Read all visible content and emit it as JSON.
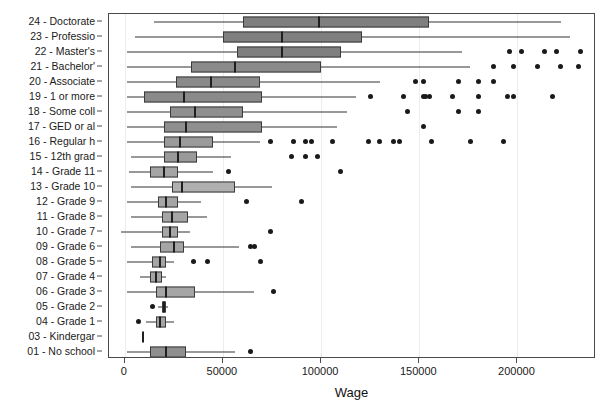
{
  "chart_data": {
    "type": "box",
    "title": "",
    "xlabel": "Wage",
    "ylabel": "",
    "xlim": [
      -8000,
      240000
    ],
    "xticks": [
      0,
      50000,
      100000,
      150000,
      200000
    ],
    "xticklabels": [
      "0",
      "50000",
      "100000",
      "150000",
      "200000"
    ],
    "grid": true,
    "grid_axis": "x",
    "legend": "none",
    "orientation": "horizontal",
    "categories": [
      "24 - Doctorate",
      "23 - Professio",
      "22 - Master's",
      "21 - Bachelor'",
      "20 - Associate",
      "19 - 1 or more",
      "18 - Some coll",
      "17 - GED or al",
      "16 - Regular h",
      "15 - 12th grad",
      "14 - Grade 11",
      "13 - Grade 10",
      "12 - Grade 9",
      "11 - Grade 8",
      "10 - Grade 7",
      "09 - Grade 6",
      "08 - Grade 5",
      "07 - Grade 4",
      "06 - Grade 3",
      "05 - Grade 2",
      "04 - Grade 1",
      "03 - Kindergar",
      "01 - No school"
    ],
    "boxes": [
      {
        "category": "24 - Doctorate",
        "whisker_low": 15000,
        "q1": 60000,
        "median": 99000,
        "q3": 155000,
        "whisker_high": 222000,
        "fill": "#7f7f7f",
        "outliers": []
      },
      {
        "category": "23 - Professio",
        "whisker_low": 5000,
        "q1": 50000,
        "median": 80000,
        "q3": 121000,
        "whisker_high": 227000,
        "fill": "#7f7f7f",
        "outliers": []
      },
      {
        "category": "22 - Master's",
        "whisker_low": 1000,
        "q1": 57000,
        "median": 80000,
        "q3": 110000,
        "whisker_high": 172000,
        "fill": "#7f7f7f",
        "outliers": [
          196000,
          202000,
          214000,
          220000,
          232000
        ]
      },
      {
        "category": "21 - Bachelor'",
        "whisker_low": 1000,
        "q1": 34000,
        "median": 56000,
        "q3": 100000,
        "whisker_high": 176000,
        "fill": "#8a8a8a",
        "outliers": [
          188000,
          198000,
          210000,
          222000,
          231000
        ]
      },
      {
        "category": "20 - Associate",
        "whisker_low": 1000,
        "q1": 26000,
        "median": 44000,
        "q3": 69000,
        "whisker_high": 130000,
        "fill": "#8a8a8a",
        "outliers": [
          148000,
          152000,
          170000,
          180000,
          188000
        ]
      },
      {
        "category": "19 - 1 or more",
        "whisker_low": 1000,
        "q1": 10000,
        "median": 30000,
        "q3": 70000,
        "whisker_high": 118000,
        "fill": "#8a8a8a",
        "outliers": [
          125000,
          142000,
          152000,
          153000,
          155000,
          167000,
          180000,
          195000,
          198000,
          218000
        ]
      },
      {
        "category": "18 - Some coll",
        "whisker_low": 1000,
        "q1": 23000,
        "median": 36000,
        "q3": 60000,
        "whisker_high": 113000,
        "fill": "#8f8f8f",
        "outliers": [
          144000,
          170000,
          180000
        ]
      },
      {
        "category": "17 - GED or al",
        "whisker_low": 1000,
        "q1": 20000,
        "median": 31000,
        "q3": 70000,
        "whisker_high": 108000,
        "fill": "#8f8f8f",
        "outliers": [
          152000
        ]
      },
      {
        "category": "16 - Regular h",
        "whisker_low": 1000,
        "q1": 20000,
        "median": 28000,
        "q3": 45000,
        "whisker_high": 69000,
        "fill": "#9a9a9a",
        "outliers": [
          74000,
          86000,
          92000,
          95000,
          106000,
          124000,
          130000,
          137000,
          140000,
          156000,
          176000,
          193000
        ]
      },
      {
        "category": "15 - 12th grad",
        "whisker_low": 3000,
        "q1": 20000,
        "median": 27000,
        "q3": 37000,
        "whisker_high": 54000,
        "fill": "#9a9a9a",
        "outliers": [
          85000,
          92000,
          98000
        ]
      },
      {
        "category": "14 - Grade 11",
        "whisker_low": 2000,
        "q1": 13000,
        "median": 20000,
        "q3": 27000,
        "whisker_high": 45000,
        "fill": "#a5a5a5",
        "outliers": [
          53000,
          110000
        ]
      },
      {
        "category": "13 - Grade 10",
        "whisker_low": 3000,
        "q1": 24000,
        "median": 29000,
        "q3": 56000,
        "whisker_high": 75000,
        "fill": "#b0b0b0",
        "outliers": []
      },
      {
        "category": "12 - Grade 9",
        "whisker_low": 1000,
        "q1": 17000,
        "median": 21000,
        "q3": 27000,
        "whisker_high": 39000,
        "fill": "#a5a5a5",
        "outliers": [
          62000,
          90000
        ]
      },
      {
        "category": "11 - Grade 8",
        "whisker_low": 3000,
        "q1": 19000,
        "median": 24000,
        "q3": 32000,
        "whisker_high": 42000,
        "fill": "#a5a5a5",
        "outliers": []
      },
      {
        "category": "10 - Grade 7",
        "whisker_low": -2000,
        "q1": 19000,
        "median": 23000,
        "q3": 27000,
        "whisker_high": 33000,
        "fill": "#a5a5a5",
        "outliers": [
          74000
        ]
      },
      {
        "category": "09 - Grade 6",
        "whisker_low": 3000,
        "q1": 18000,
        "median": 25000,
        "q3": 30000,
        "whisker_high": 58000,
        "fill": "#a5a5a5",
        "outliers": [
          64000,
          66000
        ]
      },
      {
        "category": "08 - Grade 5",
        "whisker_low": 1000,
        "q1": 14000,
        "median": 18000,
        "q3": 21000,
        "whisker_high": 25000,
        "fill": "#a5a5a5",
        "outliers": [
          35000,
          42000,
          69000
        ]
      },
      {
        "category": "07 - Grade 4",
        "whisker_low": 8000,
        "q1": 13000,
        "median": 16000,
        "q3": 19000,
        "whisker_high": 21000,
        "fill": "#a5a5a5",
        "outliers": []
      },
      {
        "category": "06 - Grade 3",
        "whisker_low": 1000,
        "q1": 16000,
        "median": 21000,
        "q3": 36000,
        "whisker_high": 66000,
        "fill": "#a5a5a5",
        "outliers": [
          76000
        ]
      },
      {
        "category": "05 - Grade 2",
        "whisker_low": 17000,
        "q1": 19000,
        "median": 20000,
        "q3": 21000,
        "whisker_high": 22000,
        "fill": "#a5a5a5",
        "outliers": [
          14000
        ]
      },
      {
        "category": "04 - Grade 1",
        "whisker_low": 11000,
        "q1": 16000,
        "median": 18000,
        "q3": 21000,
        "whisker_high": 25000,
        "fill": "#a5a5a5",
        "outliers": [
          7000
        ]
      },
      {
        "category": "03 - Kindergar",
        "whisker_low": 9500,
        "q1": 9500,
        "median": 9500,
        "q3": 9500,
        "whisker_high": 9500,
        "fill": "#a5a5a5",
        "outliers": []
      },
      {
        "category": "01 - No school",
        "whisker_low": 1000,
        "q1": 13000,
        "median": 21000,
        "q3": 31000,
        "whisker_high": 56000,
        "fill": "#8f8f8f",
        "outliers": [
          64000
        ]
      }
    ]
  }
}
